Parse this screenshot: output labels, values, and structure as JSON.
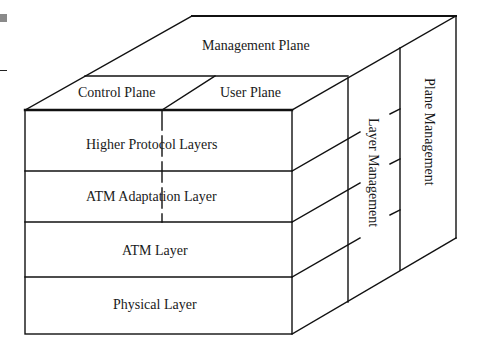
{
  "diagram": {
    "top_face": {
      "management_plane": "Management Plane",
      "control_plane": "Control Plane",
      "user_plane": "User Plane"
    },
    "front_face": {
      "layers": [
        "Higher Protocol Layers",
        "ATM Adaptation Layer",
        "ATM Layer",
        "Physical Layer"
      ]
    },
    "side_face": {
      "layer_management": "Layer Management",
      "plane_management": "Plane Management"
    },
    "colors": {
      "line": "#111111",
      "background": "#ffffff",
      "corner_mark": "#8a8a8a"
    }
  }
}
